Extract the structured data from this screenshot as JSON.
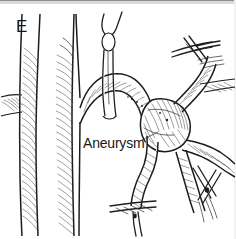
{
  "figure": {
    "panel_letter": "E",
    "callout_label": "Aneurysm",
    "caption_hidden": "",
    "type": "surgical-line-drawing",
    "colors": {
      "background": "#ffffff",
      "ink": "#1c1c1c",
      "hatch": "#3a3a3a",
      "label_text": "#171717",
      "panel_letter_text": "#141414",
      "top_border": "#8d8d8d"
    }
  },
  "anatomy": {
    "vessels": [
      {
        "name": "left-vertical-vessel",
        "label": ""
      },
      {
        "name": "center-vertical-vessel",
        "label": ""
      },
      {
        "name": "left-branch-stub",
        "label": ""
      },
      {
        "name": "arching-artery",
        "label": ""
      },
      {
        "name": "aneurysm-sac",
        "label": "Aneurysm"
      },
      {
        "name": "upper-right-branch",
        "label": ""
      },
      {
        "name": "right-branch",
        "label": ""
      },
      {
        "name": "lower-descending-branch",
        "label": ""
      },
      {
        "name": "lower-right-branch",
        "label": ""
      }
    ]
  },
  "instruments": [
    {
      "name": "vessel-loop-top",
      "label": ""
    },
    {
      "name": "clamp-upper-right",
      "label": ""
    },
    {
      "name": "clamp-lower-right",
      "label": ""
    },
    {
      "name": "clamp-bottom",
      "label": ""
    }
  ]
}
